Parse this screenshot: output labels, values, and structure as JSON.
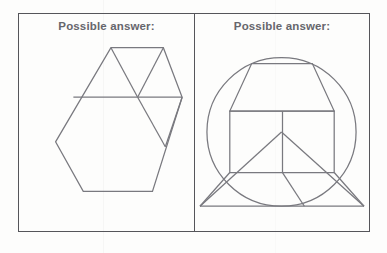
{
  "page": {
    "background_color": "#fdfdfc",
    "width": 387,
    "height": 253
  },
  "frame": {
    "border_color": "#55555a",
    "cells": [
      {
        "id": "left",
        "caption": "Possible answer:",
        "figure_name": "divided-hexagon"
      },
      {
        "id": "right",
        "caption": "Possible answer:",
        "figure_name": "circle-with-house-figure"
      }
    ]
  },
  "figures": {
    "stroke_color": "#79797f",
    "stroke_width": 1.25,
    "left": {
      "name": "divided-hexagon",
      "type": "polygon-with-internal-lines",
      "outline_label": "hexagon",
      "vertices": [
        [
          93,
          34
        ],
        [
          146,
          34
        ],
        [
          165,
          84
        ],
        [
          135,
          179
        ],
        [
          65,
          179
        ],
        [
          37,
          129
        ]
      ],
      "internal_lines": [
        {
          "name": "horizontal-midline",
          "from": [
            55,
            84
          ],
          "to": [
            165,
            84
          ]
        },
        {
          "name": "diagonal-apex-to-center",
          "from": [
            93,
            34
          ],
          "to": [
            120,
            84
          ]
        },
        {
          "name": "diagonal-topright-to-center",
          "from": [
            146,
            34
          ],
          "to": [
            120,
            84
          ]
        },
        {
          "name": "diagonal-center-to-bottomright",
          "from": [
            120,
            84
          ],
          "to": [
            148,
            134
          ]
        },
        {
          "name": "diagonal-rightvertex-to-bottomright",
          "from": [
            165,
            84
          ],
          "to": [
            148,
            134
          ]
        }
      ]
    },
    "right": {
      "name": "circle-with-house-figure",
      "type": "circle-with-internal-polygons",
      "circle": {
        "cx": 87,
        "cy": 119,
        "r": 75
      },
      "internal_shapes": [
        {
          "name": "upper-trapezoid",
          "points": [
            [
              57,
              50
            ],
            [
              118,
              50
            ],
            [
              140,
              98
            ],
            [
              35,
              98
            ]
          ]
        },
        {
          "name": "center-rectangle",
          "points": [
            [
              35,
              98
            ],
            [
              140,
              98
            ],
            [
              140,
              160
            ],
            [
              35,
              160
            ]
          ]
        },
        {
          "name": "rectangle-vertical-divider",
          "from": [
            88,
            98
          ],
          "to": [
            88,
            160
          ]
        },
        {
          "name": "lower-wide-triangle",
          "points": [
            [
              5,
              194
            ],
            [
              87,
              119
            ],
            [
              170,
              194
            ]
          ]
        },
        {
          "name": "lower-baseline",
          "from": [
            5,
            194
          ],
          "to": [
            170,
            194
          ]
        },
        {
          "name": "lower-left-slant",
          "from": [
            35,
            160
          ],
          "to": [
            5,
            194
          ]
        },
        {
          "name": "lower-right-slant",
          "from": [
            140,
            160
          ],
          "to": [
            170,
            194
          ]
        },
        {
          "name": "lower-inner-slant",
          "from": [
            88,
            160
          ],
          "to": [
            110,
            194
          ]
        }
      ]
    }
  }
}
